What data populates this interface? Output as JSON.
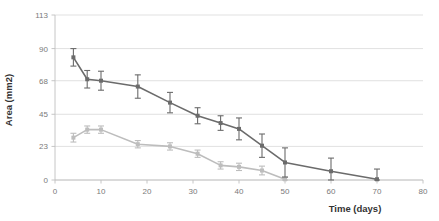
{
  "chart_data": {
    "type": "line",
    "title": "",
    "xlabel": "Time (days)",
    "ylabel": "Area (mm2)",
    "xlim": [
      0,
      80
    ],
    "ylim": [
      0,
      113
    ],
    "xticks": [
      0,
      10,
      20,
      30,
      40,
      50,
      60,
      70,
      80
    ],
    "yticks": [
      0,
      23,
      45,
      68,
      90,
      113
    ],
    "xticklabels": [
      "0",
      "10",
      "20",
      "30",
      "40",
      "50",
      "60",
      "70",
      "80"
    ],
    "yticklabels": [
      "0",
      "23",
      "45",
      "68",
      "90",
      "113"
    ],
    "grid": "horizontal",
    "legend": "none",
    "error_bars": "symmetric",
    "marker": "square",
    "series": [
      {
        "name": "dark-series",
        "color": "#6b6b6b",
        "x": [
          4,
          7,
          10,
          18,
          25,
          31,
          36,
          40,
          45,
          50,
          60,
          70
        ],
        "values": [
          84,
          69,
          68,
          64,
          53,
          44,
          39,
          35,
          23.5,
          12,
          6,
          0.5
        ],
        "errors": [
          6,
          6,
          6.5,
          8,
          7,
          5.5,
          5,
          7.5,
          8,
          10,
          9,
          7
        ]
      },
      {
        "name": "light-series",
        "color": "#bdbdbd",
        "x": [
          4,
          7,
          10,
          18,
          25,
          31,
          36,
          40,
          45,
          50
        ],
        "values": [
          29,
          34.5,
          34.5,
          24.5,
          23,
          18,
          10,
          9,
          6.5,
          0.5
        ],
        "errors": [
          3,
          2.5,
          2.5,
          2.5,
          2.5,
          2.5,
          2.5,
          2.5,
          3,
          1.5
        ]
      }
    ]
  },
  "colors": {
    "dark_series": "#6b6b6b",
    "light_series": "#bdbdbd",
    "gridline": "#d9d9d9",
    "axis": "#bfbfbf",
    "tick_text": "#7a7a7a",
    "title_text": "#333333",
    "background": "#ffffff"
  }
}
